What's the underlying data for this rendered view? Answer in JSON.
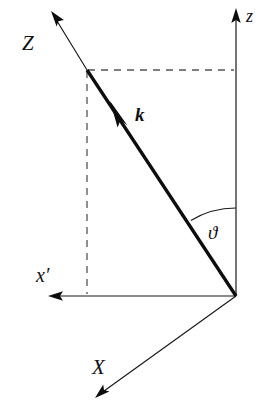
{
  "figure": {
    "background_color": "#ffffff",
    "line_color": "#1a1a1a",
    "vector_color": "#0d0d0d",
    "dash_color": "#555555",
    "width": 265,
    "height": 420
  },
  "labels": {
    "z_axis": "z",
    "Z_axis": "Z",
    "X_axis": "X",
    "x_prime_axis": "x′",
    "wave_vector": "k",
    "polar_angle": "ϑ"
  },
  "geometry": {
    "origin": {
      "x": 236,
      "y": 296
    },
    "z_axis": {
      "tip_x": 236,
      "tip_y": 10,
      "label_x": 246,
      "label_y": 22
    },
    "Z_axis": {
      "tip_x": 52,
      "tip_y": 13,
      "base_x": 87,
      "base_y": 70,
      "label_x": 22,
      "label_y": 50
    },
    "X_axis": {
      "tip_x": 96,
      "tip_y": 398,
      "label_x": 92,
      "label_y": 374
    },
    "x_prime_axis": {
      "tip_x": 50,
      "tip_y": 296,
      "label_x": 36,
      "label_y": 282
    },
    "wave_vector": {
      "tail_x": 236,
      "tail_y": 296,
      "head_x": 111,
      "head_y": 102,
      "end_x": 87,
      "end_y": 70,
      "label_x": 135,
      "label_y": 121
    },
    "dashed_horizontal": {
      "x1": 88,
      "y1": 70,
      "x2": 234,
      "y2": 70
    },
    "dashed_vertical": {
      "x1": 87,
      "y1": 71,
      "x2": 87,
      "y2": 294
    },
    "angle_arc": {
      "center_x": 236,
      "center_y": 296,
      "radius": 88,
      "label_x": 208,
      "label_y": 239
    }
  }
}
